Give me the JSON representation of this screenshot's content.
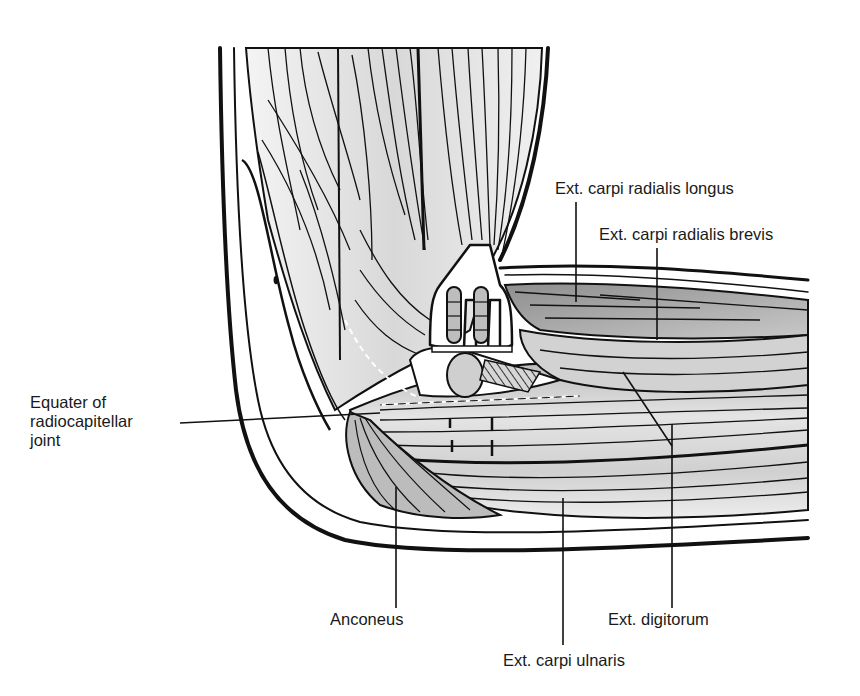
{
  "figure": {
    "colors": {
      "ink": "#111111",
      "muscle_light": "#e6e6e6",
      "muscle_mid": "#c4c4c4",
      "muscle_dark": "#9a9a9a",
      "background": "#ffffff"
    }
  },
  "labels": {
    "ecrl": "Ext. carpi radialis longus",
    "ecrb": "Ext. carpi radialis brevis",
    "equator": {
      "line1": "Equater of",
      "line2": "radiocapitellar",
      "line3": "joint"
    },
    "anconeus": "Anconeus",
    "ext_digitorum": "Ext. digitorum",
    "ecu": "Ext. carpi ulnaris"
  }
}
